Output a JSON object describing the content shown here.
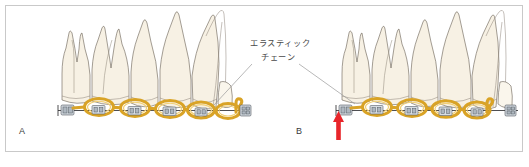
{
  "figure": {
    "background_color": "#ffffff",
    "frame_color": "#c9c9c9",
    "width": 529,
    "height": 167
  },
  "annotation": {
    "line1": "エラスティック",
    "line2": "チェーン",
    "meaning": "elastic chain",
    "text_color": "#4a4a4a",
    "leader_color": "#9a9a9a"
  },
  "panels": [
    {
      "id": "A",
      "label": "A",
      "caption": "",
      "state": "elastic chain placed, open loop at anterior end",
      "has_red_arrow": false
    },
    {
      "id": "B",
      "label": "B",
      "caption": "",
      "state": "elastic chain engaged, space closed",
      "has_red_arrow": true
    }
  ],
  "marker": {
    "name": "red-up-arrow",
    "color": "#e8252a",
    "points_to": "molar band / chain terminal in panel B"
  },
  "colors": {
    "tooth_fill": "#f7f1e4",
    "tooth_outline": "#6b6357",
    "chain_gold": "#d9a326",
    "chain_highlight": "#f2cf73",
    "bracket_metal": "#d7dde3",
    "bracket_outline": "#4a5158",
    "archwire": "#2f2f33",
    "accent_red": "#e8252a"
  }
}
